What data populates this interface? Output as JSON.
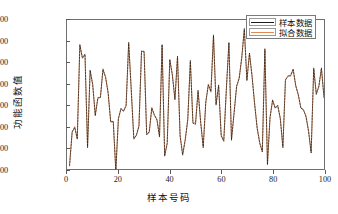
{
  "chart_data": {
    "type": "line",
    "title": "",
    "xlabel": "样本号码",
    "ylabel": "功能函数值",
    "xlim": [
      0,
      100
    ],
    "ylim": [
      320000,
      460000
    ],
    "xticks": [
      0,
      20,
      40,
      60,
      80,
      100
    ],
    "yticks": [
      320000,
      340000,
      360000,
      380000,
      400000,
      420000,
      440000,
      460000
    ],
    "xtick_labels": [
      "0",
      "20",
      "40",
      "60",
      "80",
      "100"
    ],
    "ytick_labels": [
      "320000",
      "340000",
      "360000",
      "380000",
      "400000",
      "420000",
      "440000",
      "460000"
    ],
    "grid": false,
    "legend_position": "upper right",
    "colors": {
      "sample_data": "#1a1a1a",
      "fitted_data": "#e08a52",
      "axis": "#6f6f6f",
      "text": "#141414",
      "background": "#ffffff"
    },
    "x": [
      1,
      2,
      3,
      4,
      5,
      6,
      7,
      8,
      9,
      10,
      11,
      12,
      13,
      14,
      15,
      16,
      17,
      18,
      19,
      20,
      21,
      22,
      23,
      24,
      25,
      26,
      27,
      28,
      29,
      30,
      31,
      32,
      33,
      34,
      35,
      36,
      37,
      38,
      39,
      40,
      41,
      42,
      43,
      44,
      45,
      46,
      47,
      48,
      49,
      50,
      51,
      52,
      53,
      54,
      55,
      56,
      57,
      58,
      59,
      60,
      61,
      62,
      63,
      64,
      65,
      66,
      67,
      68,
      69,
      70,
      71,
      72,
      73,
      74,
      75,
      76,
      77,
      78,
      79,
      80,
      81,
      82,
      83,
      84,
      85,
      86,
      87,
      88,
      89,
      90,
      91,
      92,
      93,
      94,
      95,
      96,
      97,
      98,
      99,
      100
    ],
    "series": [
      {
        "name": "样本数据",
        "color": "#1a1a1a",
        "values": [
          323000,
          355000,
          359000,
          348000,
          437000,
          424000,
          428000,
          340000,
          413000,
          399000,
          370000,
          387000,
          387000,
          414000,
          406000,
          392000,
          364000,
          365000,
          318000,
          367000,
          377000,
          374000,
          380000,
          439000,
          394000,
          348000,
          352000,
          360000,
          431000,
          430000,
          352000,
          355000,
          377000,
          371000,
          366000,
          350000,
          437000,
          332000,
          344000,
          423000,
          408000,
          385000,
          426000,
          351000,
          333000,
          347000,
          367000,
          422000,
          363000,
          362000,
          394000,
          364000,
          340000,
          383000,
          399000,
          393000,
          446000,
          380000,
          399000,
          351000,
          346000,
          395000,
          439000,
          347000,
          372000,
          398000,
          405000,
          425000,
          452000,
          403000,
          429000,
          407000,
          381000,
          358000,
          344000,
          336000,
          433000,
          324000,
          368000,
          385000,
          377000,
          380000,
          367000,
          340000,
          404000,
          407000,
          408000,
          414000,
          398000,
          390000,
          377000,
          376000,
          369000,
          355000,
          335000,
          415000,
          390000,
          398000,
          415000,
          387000
        ]
      },
      {
        "name": "拟合数据",
        "color": "#e08a52",
        "values": [
          324000,
          354000,
          360000,
          349000,
          436000,
          425000,
          427000,
          341000,
          412000,
          400000,
          371000,
          386000,
          388000,
          413000,
          407000,
          391000,
          365000,
          364000,
          319000,
          368000,
          376000,
          375000,
          379000,
          438000,
          395000,
          349000,
          351000,
          361000,
          430000,
          431000,
          353000,
          354000,
          378000,
          370000,
          367000,
          351000,
          436000,
          333000,
          345000,
          422000,
          409000,
          386000,
          425000,
          352000,
          334000,
          348000,
          366000,
          421000,
          364000,
          363000,
          393000,
          365000,
          341000,
          382000,
          400000,
          392000,
          445000,
          381000,
          398000,
          352000,
          347000,
          394000,
          438000,
          348000,
          373000,
          397000,
          406000,
          424000,
          451000,
          404000,
          428000,
          408000,
          382000,
          359000,
          345000,
          337000,
          432000,
          325000,
          369000,
          384000,
          378000,
          379000,
          368000,
          341000,
          403000,
          408000,
          407000,
          413000,
          399000,
          389000,
          378000,
          375000,
          370000,
          356000,
          336000,
          414000,
          391000,
          397000,
          414000,
          388000
        ]
      }
    ]
  },
  "legend": {
    "items": [
      {
        "label": "样本数据"
      },
      {
        "label": "拟合数据"
      }
    ]
  }
}
